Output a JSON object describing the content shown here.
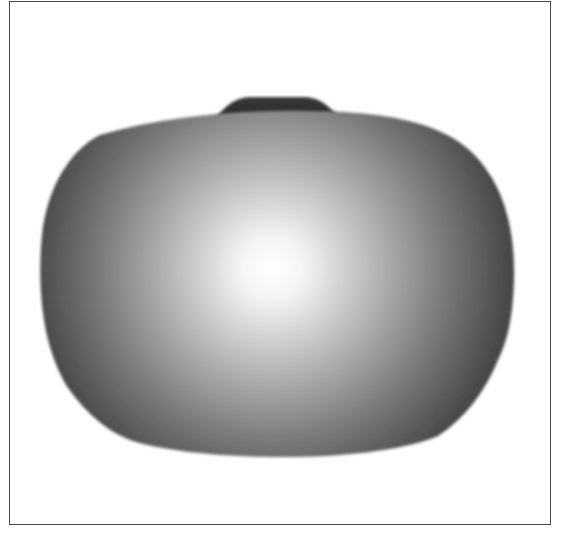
{
  "figure": {
    "colors": {
      "background": "#ffffff",
      "frame": "#4a4a4a",
      "highlight": "#ffffff",
      "mid": "#a8a8a8",
      "shadow": "#3a3a3a",
      "bump": "#2e2e2e"
    },
    "highlight_center": {
      "x": 272,
      "y": 268
    }
  }
}
